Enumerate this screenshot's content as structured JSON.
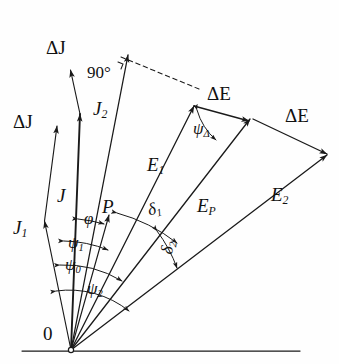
{
  "figure": {
    "type": "vector-phasor-diagram",
    "background_color": "#fefefe",
    "stroke_color": "#1a1a1a",
    "origin_label": "0",
    "baseline": {
      "y": 351,
      "x_start": 22,
      "x_end": 300
    }
  },
  "labels": {
    "origin": "0",
    "delta_j_upper": "ΔJ",
    "delta_j_lower": "ΔJ",
    "j2": "J",
    "j2_sub": "2",
    "j": "J",
    "j1": "J",
    "j1_sub": "1",
    "p": "P",
    "e1": "E",
    "e1_sub": "1",
    "ep": "E",
    "ep_sub": "P",
    "e2": "E",
    "e2_sub": "2",
    "delta_e_upper": "ΔE",
    "delta_e_right": "ΔE",
    "angle_90": "90°",
    "phi": "φ",
    "psi1": "ψ",
    "psi1_sub": "1",
    "psi0": "ψ",
    "psi0_sub": "0",
    "psi2": "ψ",
    "psi2_sub": "2",
    "psi_delta": "ψ",
    "psi_delta_sub": "Δ",
    "delta1": "δ",
    "delta1_sub": "1",
    "delta2": "δ",
    "delta2_sub": "2"
  },
  "vectors": [
    {
      "name": "J1",
      "from": [
        71,
        350
      ],
      "to": [
        44,
        219
      ],
      "label": "J1"
    },
    {
      "name": "J",
      "from": [
        71,
        350
      ],
      "to": [
        80,
        111
      ],
      "label": "J"
    },
    {
      "name": "J2",
      "from": [
        71,
        350
      ],
      "to": [
        129,
        52
      ],
      "label": "J2"
    },
    {
      "name": "P",
      "from": [
        71,
        350
      ],
      "to": [
        110,
        212
      ],
      "label": "P"
    },
    {
      "name": "E1",
      "from": [
        71,
        350
      ],
      "to": [
        196,
        103
      ],
      "label": "E1"
    },
    {
      "name": "EP",
      "from": [
        71,
        350
      ],
      "to": [
        253,
        120
      ],
      "label": "EP"
    },
    {
      "name": "E2",
      "from": [
        71,
        350
      ],
      "to": [
        330,
        156
      ],
      "label": "E2"
    },
    {
      "name": "dJ-upper",
      "from": [
        80,
        111
      ],
      "to": [
        70,
        67
      ],
      "label": "ΔJ"
    },
    {
      "name": "dJ-lower",
      "from": [
        44,
        219
      ],
      "to": [
        57,
        122
      ],
      "label": "ΔJ"
    },
    {
      "name": "dE-upper",
      "from": [
        196,
        103
      ],
      "to": [
        253,
        120
      ],
      "label": "ΔE"
    },
    {
      "name": "dE-right",
      "from": [
        253,
        120
      ],
      "to": [
        330,
        156
      ],
      "label": "ΔE"
    }
  ],
  "dashed_line": {
    "from": [
      122,
      57
    ],
    "to": [
      200,
      89
    ]
  },
  "angle_arcs": [
    {
      "name": "phi",
      "label": "φ"
    },
    {
      "name": "psi1",
      "label": "ψ₁"
    },
    {
      "name": "psi0",
      "label": "ψ₀"
    },
    {
      "name": "psi2",
      "label": "ψ₂"
    },
    {
      "name": "delta1",
      "label": "δ₁"
    },
    {
      "name": "delta2",
      "label": "δ₂"
    },
    {
      "name": "psiDelta",
      "label": "ψΔ"
    },
    {
      "name": "right-angle",
      "label": "90°"
    }
  ]
}
